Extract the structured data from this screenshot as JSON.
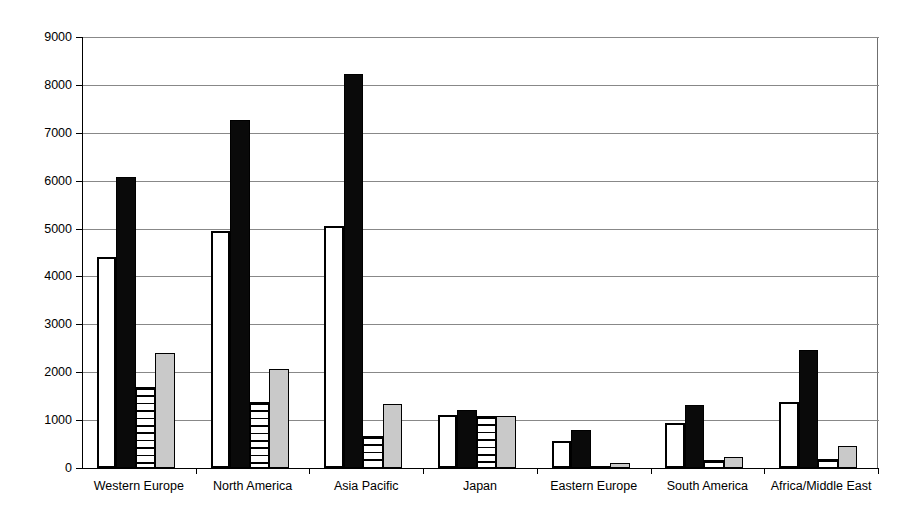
{
  "chart_data": {
    "type": "bar",
    "title": "",
    "subtitle": "",
    "xlabel": "",
    "ylabel": "Kilo-tons",
    "ylim": [
      0,
      9000
    ],
    "ytick_labels": [
      "0",
      "1000",
      "2000",
      "3000",
      "4000",
      "5000",
      "6000",
      "7000",
      "8000",
      "9000"
    ],
    "ytick_values": [
      0,
      1000,
      2000,
      3000,
      4000,
      5000,
      6000,
      7000,
      8000,
      9000
    ],
    "grid": true,
    "legend": "none",
    "categories": [
      "Western Europe",
      "North America",
      "Asia Pacific",
      "Japan",
      "Eastern Europe",
      "South America",
      "Africa/Middle East"
    ],
    "series": [
      {
        "name": "series-1",
        "style": "white",
        "values": [
          4400,
          4950,
          5060,
          1110,
          560,
          940,
          1380
        ]
      },
      {
        "name": "series-2",
        "style": "black",
        "values": [
          6080,
          7270,
          8220,
          1215,
          790,
          1320,
          2470
        ]
      },
      {
        "name": "series-3",
        "style": "horizontal-stripes",
        "values": [
          1690,
          1370,
          660,
          1090,
          30,
          170,
          190
        ]
      },
      {
        "name": "series-4",
        "style": "gray",
        "values": [
          2400,
          2060,
          1340,
          1080,
          110,
          240,
          450
        ]
      }
    ]
  },
  "colors": {
    "series_white_fill": "#ffffff",
    "series_black_fill": "#0a0a0a",
    "series_striped_fill": "#ffffff",
    "series_gray_fill": "#c9c9c9",
    "outline": "#000000",
    "gridline": "#888888",
    "background": "#ffffff"
  }
}
